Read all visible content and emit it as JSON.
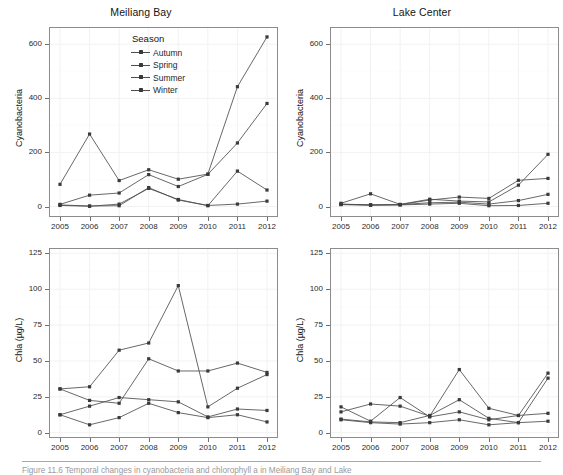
{
  "figure": {
    "caption_text": "Figure 11.6  Temporal changes in cyanobacteria and chlorophyll a in Meiliang Bay and Lake"
  },
  "legend": {
    "title": "Season",
    "items": [
      {
        "label": "Autumn"
      },
      {
        "label": "Spring"
      },
      {
        "label": "Summer"
      },
      {
        "label": "Winter"
      }
    ]
  },
  "chart_data": [
    {
      "type": "line",
      "panel": "top-left",
      "title": "Meiliang Bay",
      "xlabel": "",
      "ylabel": "Cyanobacteria",
      "x": [
        "2005",
        "2006",
        "2007",
        "2008",
        "2009",
        "2010",
        "2011",
        "2012"
      ],
      "xticks": [
        "2005",
        "2006",
        "2007",
        "2008",
        "2009",
        "2010",
        "2011",
        "2012"
      ],
      "yticks": [
        0,
        200,
        400,
        600
      ],
      "ylim": [
        -35,
        660
      ],
      "grid": true,
      "legend_position": "inside-top-center",
      "series": [
        {
          "name": "Autumn",
          "values": [
            82,
            268,
            96,
            136,
            101,
            120,
            443,
            627
          ]
        },
        {
          "name": "Spring",
          "values": [
            6,
            2,
            3,
            70,
            24,
            4,
            9,
            20
          ]
        },
        {
          "name": "Summer",
          "values": [
            8,
            42,
            50,
            118,
            74,
            119,
            235,
            381
          ]
        },
        {
          "name": "Winter",
          "values": [
            4,
            1,
            9,
            67,
            26,
            3,
            131,
            61
          ]
        }
      ]
    },
    {
      "type": "line",
      "panel": "top-right",
      "title": "Lake Center",
      "xlabel": "",
      "ylabel": "Cyanobacteria",
      "x": [
        "2005",
        "2006",
        "2007",
        "2008",
        "2009",
        "2010",
        "2011",
        "2012"
      ],
      "xticks": [
        "2005",
        "2006",
        "2007",
        "2008",
        "2009",
        "2010",
        "2011",
        "2012"
      ],
      "yticks": [
        0,
        200,
        400,
        600
      ],
      "ylim": [
        -35,
        660
      ],
      "grid": true,
      "legend_position": "none",
      "series": [
        {
          "name": "Autumn",
          "values": [
            12,
            47,
            8,
            27,
            20,
            17,
            79,
            193
          ]
        },
        {
          "name": "Spring",
          "values": [
            7,
            5,
            6,
            9,
            12,
            3,
            4,
            12
          ]
        },
        {
          "name": "Summer",
          "values": [
            9,
            6,
            7,
            24,
            35,
            30,
            97,
            104
          ]
        },
        {
          "name": "Winter",
          "values": [
            8,
            6,
            7,
            14,
            16,
            9,
            22,
            45
          ]
        }
      ]
    },
    {
      "type": "line",
      "panel": "bottom-left",
      "title": "",
      "xlabel": "",
      "ylabel": "Chla (µg/L)",
      "x": [
        "2005",
        "2006",
        "2007",
        "2008",
        "2009",
        "2010",
        "2011",
        "2012"
      ],
      "xticks": [
        "2005",
        "2006",
        "2007",
        "2008",
        "2009",
        "2010",
        "2011",
        "2012"
      ],
      "yticks": [
        0,
        25,
        50,
        75,
        100,
        125
      ],
      "ylim": [
        -3,
        128
      ],
      "grid": true,
      "legend_position": "none",
      "series": [
        {
          "name": "Autumn",
          "values": [
            30.5,
            32,
            57.5,
            62.5,
            102.5,
            18,
            31,
            40.5
          ]
        },
        {
          "name": "Spring",
          "values": [
            12.5,
            5.5,
            10.5,
            20.5,
            14,
            10.5,
            12.5,
            7.5
          ]
        },
        {
          "name": "Summer",
          "values": [
            30.5,
            22.5,
            20.5,
            51.5,
            43,
            43,
            48.5,
            42
          ]
        },
        {
          "name": "Winter",
          "values": [
            12.5,
            18.5,
            24.5,
            23,
            21.5,
            11,
            16.5,
            15.5
          ]
        }
      ]
    },
    {
      "type": "line",
      "panel": "bottom-right",
      "title": "",
      "xlabel": "",
      "ylabel": "Chla (µg/L)",
      "x": [
        "2005",
        "2006",
        "2007",
        "2008",
        "2009",
        "2010",
        "2011",
        "2012"
      ],
      "xticks": [
        "2005",
        "2006",
        "2007",
        "2008",
        "2009",
        "2010",
        "2011",
        "2012"
      ],
      "yticks": [
        0,
        25,
        50,
        75,
        100,
        125
      ],
      "ylim": [
        -3,
        128
      ],
      "grid": true,
      "legend_position": "none",
      "series": [
        {
          "name": "Autumn",
          "values": [
            14.5,
            20,
            18.5,
            11.5,
            44,
            17,
            12,
            41.5
          ]
        },
        {
          "name": "Spring",
          "values": [
            9,
            7,
            6,
            7,
            9,
            5.5,
            7,
            8
          ]
        },
        {
          "name": "Summer",
          "values": [
            9.5,
            7.5,
            7,
            12,
            23,
            10,
            7,
            38
          ]
        },
        {
          "name": "Winter",
          "values": [
            18,
            8,
            24.5,
            11,
            14.5,
            9,
            12,
            13.5
          ]
        }
      ]
    }
  ],
  "style": {
    "line_color": "#4d4d4d",
    "point_color": "#3a3a3a",
    "panel_border": "#8c8c8c",
    "grid_color": "#f2f2f2",
    "text_color": "#141414"
  }
}
